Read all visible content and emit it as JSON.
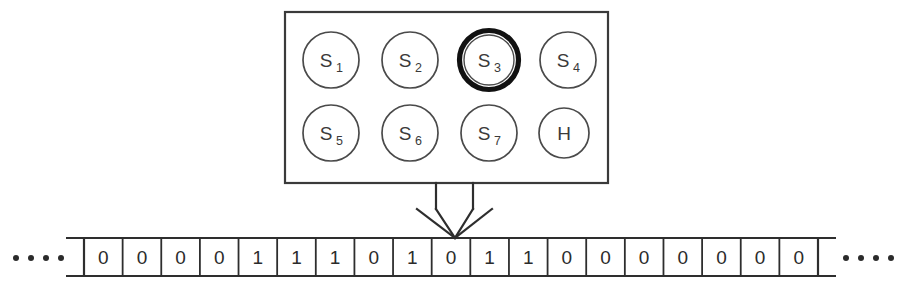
{
  "diagram": {
    "colors": {
      "stroke": "#3a3a3a",
      "highlight": "#111111",
      "background": "#ffffff",
      "text": "#2b2b2b"
    },
    "state_box": {
      "label": "state-set-box",
      "rows": [
        [
          {
            "name": "S1",
            "base": "S",
            "sub": "1",
            "active": false
          },
          {
            "name": "S2",
            "base": "S",
            "sub": "2",
            "active": false
          },
          {
            "name": "S3",
            "base": "S",
            "sub": "3",
            "active": true
          },
          {
            "name": "S4",
            "base": "S",
            "sub": "4",
            "active": false
          }
        ],
        [
          {
            "name": "S5",
            "base": "S",
            "sub": "5",
            "active": false
          },
          {
            "name": "S6",
            "base": "S",
            "sub": "6",
            "active": false
          },
          {
            "name": "S7",
            "base": "S",
            "sub": "7",
            "active": false
          },
          {
            "name": "H",
            "base": "H",
            "sub": "",
            "active": false
          }
        ]
      ],
      "active_state": "S3"
    },
    "head_arrow": {
      "label": "read-write-head-arrow",
      "points_to_cell_index": 9
    },
    "tape": {
      "label": "binary-tape",
      "left_ellipsis": "....",
      "right_ellipsis": "....",
      "ellipsis_dot_count": 4,
      "cell_count": 19,
      "cells": [
        "0",
        "0",
        "0",
        "0",
        "1",
        "1",
        "1",
        "0",
        "1",
        "0",
        "1",
        "1",
        "0",
        "0",
        "0",
        "0",
        "0",
        "0",
        "0"
      ]
    }
  },
  "chart_data": {
    "type": "diagram",
    "states": [
      "S1",
      "S2",
      "S3",
      "S4",
      "S5",
      "S6",
      "S7",
      "H"
    ],
    "active_state": "S3",
    "tape_symbols": [
      "0",
      "0",
      "0",
      "0",
      "1",
      "1",
      "1",
      "0",
      "1",
      "0",
      "1",
      "1",
      "0",
      "0",
      "0",
      "0",
      "0",
      "0",
      "0"
    ],
    "head_position_index": 9,
    "head_symbol": "0"
  }
}
